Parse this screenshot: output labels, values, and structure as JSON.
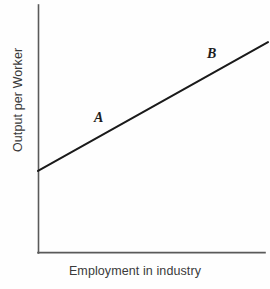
{
  "chart_data": {
    "type": "line",
    "title": "",
    "subtitle": "",
    "xlabel": "Employment in industry",
    "ylabel": "Output per Worker",
    "grid": false,
    "legend": "none",
    "xlim": [
      0,
      100
    ],
    "ylim": [
      0,
      100
    ],
    "xticks": [],
    "yticks": [],
    "series": [
      {
        "name": "Output per worker schedule",
        "x": [
          0,
          100
        ],
        "values": [
          33,
          85
        ],
        "color": "#1a1a1a",
        "style": "solid",
        "width": 2
      }
    ],
    "annotations": [
      {
        "text": "A",
        "x": 26,
        "y": 50,
        "style": "italic",
        "position": "above-line"
      },
      {
        "text": "B",
        "x": 76,
        "y": 75,
        "style": "italic",
        "position": "above-line"
      }
    ],
    "axes": {
      "spines": [
        "left",
        "bottom"
      ],
      "axis_color": "#5a5a5a",
      "background": "#fefefe"
    }
  },
  "figure": {
    "xlabel": "Employment in industry",
    "ylabel": "Output per Worker",
    "point_a": "A",
    "point_b": "B"
  }
}
